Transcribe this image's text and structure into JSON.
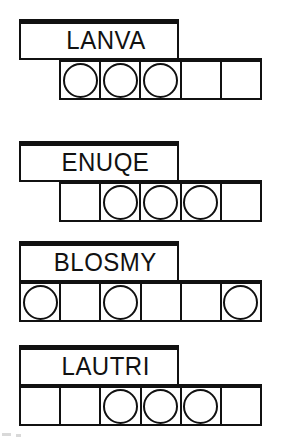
{
  "sheet": {
    "title": "Word and token grid worksheet",
    "ink_color": "#111111",
    "background_color": "#ffffff"
  },
  "groups": [
    {
      "id": "group-lanva",
      "word": "LANVA",
      "word_box": {
        "top": 19,
        "left": 19,
        "width": 160,
        "height": 41
      },
      "strip": {
        "top": 58,
        "left": 59,
        "width": 203,
        "cell_count": 5
      },
      "cells": [
        {
          "index": 1,
          "token": "circle"
        },
        {
          "index": 2,
          "token": "circle"
        },
        {
          "index": 3,
          "token": "circle"
        },
        {
          "index": 4,
          "token": ""
        },
        {
          "index": 5,
          "token": ""
        }
      ]
    },
    {
      "id": "group-enuqe",
      "word": "ENUQE",
      "word_box": {
        "top": 141,
        "left": 19,
        "width": 160,
        "height": 41
      },
      "strip": {
        "top": 180,
        "left": 59,
        "width": 203,
        "cell_count": 5
      },
      "cells": [
        {
          "index": 1,
          "token": ""
        },
        {
          "index": 2,
          "token": "circle"
        },
        {
          "index": 3,
          "token": "circle"
        },
        {
          "index": 4,
          "token": "circle"
        },
        {
          "index": 5,
          "token": ""
        }
      ]
    },
    {
      "id": "group-blosmy",
      "word": "BLOSMY",
      "word_box": {
        "top": 241,
        "left": 19,
        "width": 160,
        "height": 41
      },
      "strip": {
        "top": 280,
        "left": 19,
        "width": 243,
        "cell_count": 6
      },
      "cells": [
        {
          "index": 1,
          "token": "circle"
        },
        {
          "index": 2,
          "token": ""
        },
        {
          "index": 3,
          "token": "circle"
        },
        {
          "index": 4,
          "token": ""
        },
        {
          "index": 5,
          "token": ""
        },
        {
          "index": 6,
          "token": "circle"
        }
      ]
    },
    {
      "id": "group-lautri",
      "word": "LAUTRI",
      "word_box": {
        "top": 345,
        "left": 19,
        "width": 160,
        "height": 41
      },
      "strip": {
        "top": 384,
        "left": 19,
        "width": 243,
        "cell_count": 6
      },
      "cells": [
        {
          "index": 1,
          "token": ""
        },
        {
          "index": 2,
          "token": ""
        },
        {
          "index": 3,
          "token": "circle"
        },
        {
          "index": 4,
          "token": "circle"
        },
        {
          "index": 5,
          "token": "circle"
        },
        {
          "index": 6,
          "token": ""
        }
      ]
    }
  ]
}
